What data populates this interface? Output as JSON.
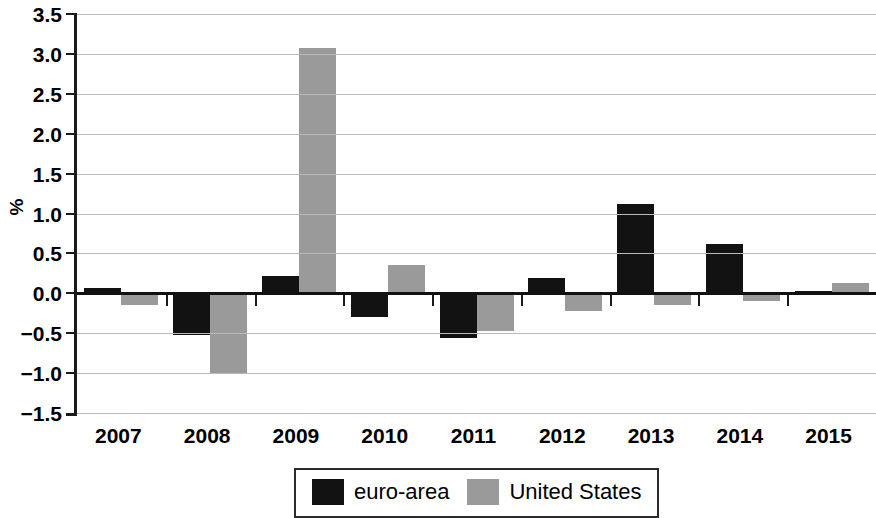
{
  "chart_data": {
    "type": "bar",
    "title": "",
    "subtitle": "",
    "xlabel": "",
    "ylabel": "%",
    "categories": [
      "2007",
      "2008",
      "2009",
      "2010",
      "2011",
      "2012",
      "2013",
      "2014",
      "2015"
    ],
    "series": [
      {
        "name": "euro-area",
        "color": "#121212",
        "values": [
          0.07,
          -0.52,
          0.22,
          -0.3,
          -0.56,
          0.19,
          1.12,
          0.62,
          0.03
        ]
      },
      {
        "name": "United States",
        "color": "#9a9a9a",
        "values": [
          -0.15,
          -1.0,
          3.07,
          0.36,
          -0.47,
          -0.22,
          -0.15,
          -0.1,
          0.13
        ]
      }
    ],
    "ylim": [
      -1.5,
      3.5
    ],
    "ytick_step": 0.5,
    "ytick_labels": [
      "3.5",
      "3.0",
      "2.5",
      "2.0",
      "1.5",
      "1.0",
      "0.5",
      "0.0",
      "−0.5",
      "−1.0",
      "−1.5"
    ],
    "ytick_values": [
      3.5,
      3.0,
      2.5,
      2.0,
      1.5,
      1.0,
      0.5,
      0.0,
      -0.5,
      -1.0,
      -1.5
    ],
    "grid": true,
    "grid_axis": "y",
    "legend_position": "bottom-center",
    "legend": [
      {
        "label": "euro-area",
        "color": "#121212"
      },
      {
        "label": "United States",
        "color": "#9a9a9a"
      }
    ]
  }
}
